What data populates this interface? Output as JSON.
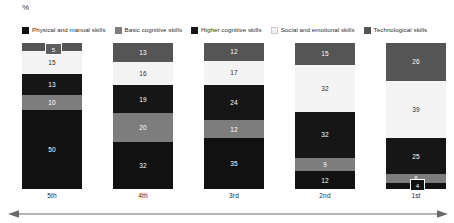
{
  "axis_unit": "%",
  "legend": {
    "items": [
      {
        "label": "Physical and manual skills",
        "color": "#111111",
        "swatch_icon": "legend-swatch-icon"
      },
      {
        "label": "Basic cognitive skills",
        "color": "#7d7d7d",
        "swatch_icon": "legend-swatch-icon"
      },
      {
        "label": "Higher cognitive skills",
        "color": "#161616",
        "swatch_icon": "legend-swatch-icon"
      },
      {
        "label": "Social and emotional skills",
        "color": "#f2f2f2",
        "swatch_icon": "legend-swatch-icon"
      },
      {
        "label": "Technological skills",
        "color": "#555555",
        "swatch_icon": "legend-swatch-icon"
      }
    ]
  },
  "chart_data": {
    "type": "bar",
    "title": "",
    "subtitle": "",
    "xlabel": "",
    "ylabel": "%",
    "ylim": [
      0,
      100
    ],
    "grid": false,
    "stacked": true,
    "legend_position": "top",
    "categories": [
      "5th",
      "4th",
      "3rd",
      "2nd",
      "1st"
    ],
    "series": [
      {
        "name": "Technological skills",
        "color": "#555555",
        "text_color": "#ffffff",
        "values": [
          5,
          13,
          12,
          15,
          26
        ]
      },
      {
        "name": "Social and emotional skills",
        "color": "#f4f4f4",
        "text_color": "#2b2b2b",
        "values": [
          15,
          16,
          17,
          32,
          39
        ]
      },
      {
        "name": "Higher cognitive skills",
        "color": "#161616",
        "text_color": "#ffffff",
        "values": [
          13,
          19,
          24,
          32,
          25
        ]
      },
      {
        "name": "Basic cognitive skills",
        "color": "#7d7d7d",
        "text_color": "#ffffff",
        "values": [
          10,
          20,
          12,
          9,
          6
        ]
      },
      {
        "name": "Physical and manual skills",
        "color": "#111111",
        "text_color": "#ffffff",
        "values": [
          50,
          32,
          35,
          12,
          4
        ]
      }
    ],
    "annotations": [
      {
        "name": "callout-5th-technological",
        "category": "5th",
        "value": "5"
      },
      {
        "name": "callout-1st-physical",
        "category": "1st",
        "value": "4"
      }
    ]
  },
  "axis_arrow": {
    "name": "horizontal-double-arrow",
    "color": "#5a5a5a"
  }
}
